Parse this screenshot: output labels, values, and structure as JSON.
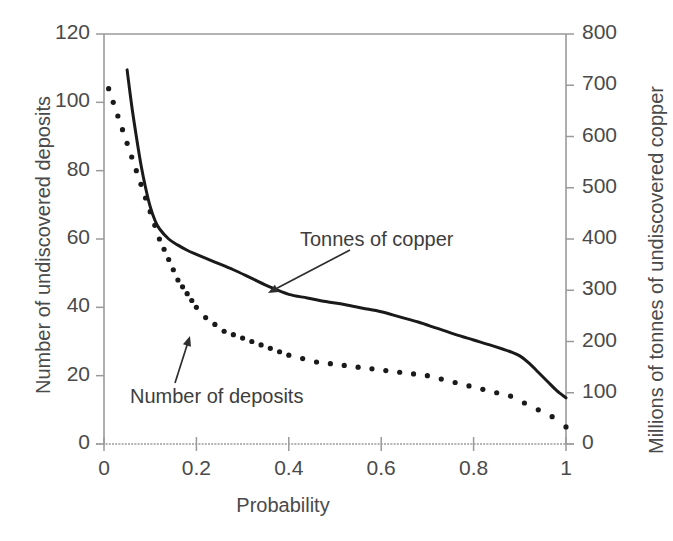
{
  "chart_data": {
    "type": "line",
    "title": "",
    "xlabel": "Probability",
    "ylabel": "Number of undiscovered deposits",
    "ylabel_right": "Millions of tonnes of undiscovered copper",
    "xlim": [
      0,
      1
    ],
    "ylim": [
      0,
      120
    ],
    "ylim_right": [
      0,
      800
    ],
    "grid": false,
    "legend_position": "inline-annotations",
    "xticks": [
      "0",
      "0.2",
      "0.4",
      "0.6",
      "0.8",
      "1"
    ],
    "xtick_values": [
      0,
      0.2,
      0.4,
      0.6,
      0.8,
      1
    ],
    "yticks_left": [
      "0",
      "20",
      "40",
      "60",
      "80",
      "100",
      "120"
    ],
    "ytick_values_left": [
      0,
      20,
      40,
      60,
      80,
      100,
      120
    ],
    "yticks_right": [
      "0",
      "100",
      "200",
      "300",
      "400",
      "500",
      "600",
      "700",
      "800"
    ],
    "ytick_values_right": [
      0,
      100,
      200,
      300,
      400,
      500,
      600,
      700,
      800
    ],
    "series": [
      {
        "name": "Tonnes of copper",
        "style": "solid",
        "axis": "right",
        "color": "#1a1a1a",
        "x": [
          0.05,
          0.06,
          0.07,
          0.08,
          0.09,
          0.1,
          0.11,
          0.12,
          0.14,
          0.16,
          0.18,
          0.2,
          0.24,
          0.28,
          0.32,
          0.36,
          0.4,
          0.44,
          0.48,
          0.52,
          0.56,
          0.6,
          0.64,
          0.68,
          0.72,
          0.76,
          0.8,
          0.84,
          0.88,
          0.9,
          0.92,
          0.94,
          0.96,
          0.98,
          1.0
        ],
        "values": [
          730,
          660,
          600,
          545,
          500,
          463,
          437,
          420,
          400,
          388,
          378,
          370,
          355,
          340,
          323,
          306,
          292,
          285,
          278,
          272,
          265,
          258,
          248,
          238,
          226,
          214,
          203,
          192,
          180,
          172,
          158,
          140,
          122,
          104,
          90
        ]
      },
      {
        "name": "Number of deposits",
        "style": "dotted",
        "axis": "left",
        "color": "#1a1a1a",
        "x": [
          0.01,
          0.02,
          0.03,
          0.04,
          0.05,
          0.06,
          0.07,
          0.08,
          0.09,
          0.1,
          0.11,
          0.12,
          0.13,
          0.14,
          0.15,
          0.16,
          0.17,
          0.18,
          0.19,
          0.2,
          0.22,
          0.24,
          0.26,
          0.28,
          0.3,
          0.32,
          0.34,
          0.36,
          0.38,
          0.4,
          0.43,
          0.46,
          0.49,
          0.52,
          0.55,
          0.58,
          0.61,
          0.64,
          0.67,
          0.7,
          0.73,
          0.76,
          0.79,
          0.82,
          0.85,
          0.88,
          0.91,
          0.94,
          0.97,
          1.0
        ],
        "values": [
          104,
          100,
          96,
          92,
          88,
          84,
          80,
          76,
          72,
          68,
          64,
          60,
          57,
          54,
          51,
          48,
          46,
          44,
          42,
          40,
          37,
          35,
          33,
          32,
          31,
          30,
          29,
          28,
          27,
          26,
          25,
          24,
          23.5,
          23,
          22.5,
          22,
          21.5,
          21,
          20.5,
          20,
          19,
          18,
          17,
          16,
          15,
          14,
          12,
          10,
          8,
          5
        ]
      }
    ],
    "annotations": [
      {
        "text": "Tonnes of copper",
        "label_x": 300,
        "label_y": 228,
        "arrow_from_x": 350,
        "arrow_from_y": 250,
        "arrow_to_x": 268,
        "arrow_to_y": 293
      },
      {
        "text": "Number of deposits",
        "label_x": 130,
        "label_y": 385,
        "arrow_from_x": 175,
        "arrow_from_y": 383,
        "arrow_to_x": 190,
        "arrow_to_y": 336
      }
    ]
  },
  "geometry": {
    "left": 104,
    "right": 566,
    "top": 34,
    "bottom": 444
  },
  "colors": {
    "axis": "#9a9a9a",
    "curve": "#1a1a1a",
    "text": "#4a4a4a",
    "background": "#ffffff"
  }
}
